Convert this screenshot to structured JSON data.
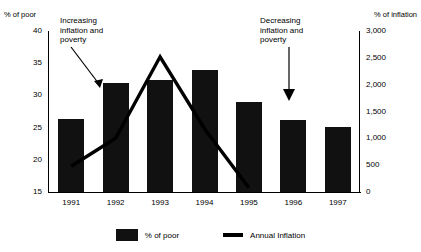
{
  "chart_data": {
    "type": "bar",
    "title": "",
    "categories": [
      "1991",
      "1992",
      "1993",
      "1994",
      "1995",
      "1996",
      "1997"
    ],
    "series": [
      {
        "name": "% of poor",
        "type": "bar",
        "axis": "left",
        "values": [
          26.4,
          32.0,
          32.4,
          34.0,
          29.0,
          26.2,
          25.1
        ]
      },
      {
        "name": "Annual Inflation",
        "type": "line",
        "axis": "right",
        "values": [
          480,
          1000,
          2520,
          1180,
          80,
          null,
          null
        ]
      }
    ],
    "xlabel": "",
    "ylabel": "% of poor",
    "ylabel_right": "% of inflation",
    "ylim": [
      15,
      40
    ],
    "yticks": [
      "40",
      "35",
      "30",
      "25",
      "20",
      "15"
    ],
    "ylim_right": [
      0,
      3000
    ],
    "yticks_right": [
      "3,000",
      "2,500",
      "2,000",
      "1,500",
      "1,000",
      "500",
      "0"
    ],
    "grid": false,
    "legend_position": "bottom",
    "annotations": [
      {
        "name": "increasing-inflation-and-poverty",
        "text": "Increasing\ninflation and\npoverty",
        "arrow": "down-right"
      },
      {
        "name": "decreasing-inflation-and-poverty",
        "text": "Decreasing\ninflation and\npoverty",
        "arrow": "down"
      }
    ]
  },
  "legend": {
    "bar_label": "% of poor",
    "line_label": "Annual Inflation"
  }
}
